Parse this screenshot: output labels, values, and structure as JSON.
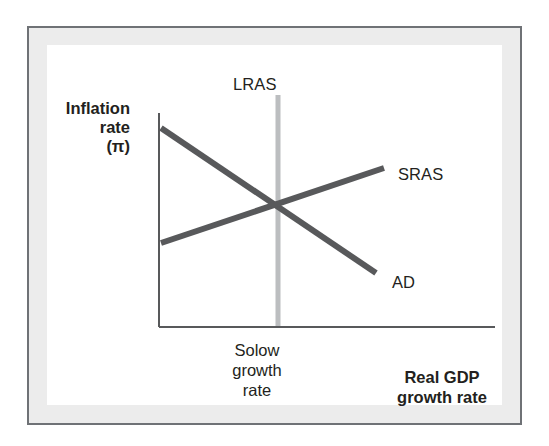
{
  "figure": {
    "type": "economics-diagram",
    "frame_border_color": "#6f7276",
    "frame_fill_color": "#ececec",
    "plot_background": "#ffffff"
  },
  "axes": {
    "y_label": "Inflation\nrate\n(π)",
    "x_label": "Real GDP\ngrowth rate",
    "axis_color": "#58595b",
    "origin_x": 112,
    "origin_y": 282,
    "y_axis_top": 68,
    "x_axis_right": 448
  },
  "curves": [
    {
      "name": "AD",
      "label": "AD",
      "kind": "downward-sloping",
      "color": "#58595b",
      "width": 6,
      "x1": 114,
      "y1": 83,
      "x2": 329,
      "y2": 228
    },
    {
      "name": "SRAS",
      "label": "SRAS",
      "kind": "upward-sloping",
      "color": "#58595b",
      "width": 6,
      "x1": 114,
      "y1": 198,
      "x2": 337,
      "y2": 123
    },
    {
      "name": "LRAS",
      "label": "LRAS",
      "kind": "vertical",
      "color": "#bcbec0",
      "width": 5,
      "x1": 231,
      "y1": 50,
      "x2": 231,
      "y2": 282
    }
  ],
  "annotations": {
    "lras_label": "LRAS",
    "sras_label": "SRAS",
    "ad_label": "AD",
    "solow_label": "Solow\ngrowth\nrate"
  },
  "chart_data": {
    "type": "line",
    "title": "",
    "xlabel": "Real GDP growth rate",
    "ylabel": "Inflation rate (π)",
    "series": [
      {
        "name": "AD",
        "points": [
          [
            0.0,
            0.93
          ],
          [
            1.0,
            0.26
          ]
        ]
      },
      {
        "name": "SRAS",
        "points": [
          [
            0.0,
            0.39
          ],
          [
            1.0,
            0.74
          ]
        ]
      },
      {
        "name": "LRAS",
        "points": [
          [
            0.35,
            0.0
          ],
          [
            0.35,
            1.0
          ]
        ]
      }
    ],
    "equilibrium": {
      "x": 0.35,
      "label": "Solow growth rate"
    },
    "grid": false,
    "legend": "inline-labels"
  }
}
